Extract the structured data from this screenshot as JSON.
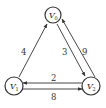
{
  "diagram": {
    "type": "directed-weighted-graph",
    "nodes": [
      {
        "id": "V0",
        "label": "V",
        "subscript": "0",
        "x": 53,
        "y": 15
      },
      {
        "id": "V1",
        "label": "V",
        "subscript": "1",
        "x": 14,
        "y": 85
      },
      {
        "id": "V2",
        "label": "V",
        "subscript": "2",
        "x": 91,
        "y": 85
      }
    ],
    "edges": [
      {
        "from": "V1",
        "to": "V0",
        "weight": "4"
      },
      {
        "from": "V0",
        "to": "V2",
        "weight": "3"
      },
      {
        "from": "V2",
        "to": "V0",
        "weight": "9"
      },
      {
        "from": "V2",
        "to": "V1",
        "weight": "2"
      },
      {
        "from": "V1",
        "to": "V2",
        "weight": "8"
      }
    ]
  }
}
